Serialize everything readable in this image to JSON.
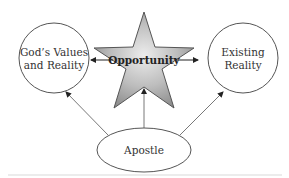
{
  "diagram": {
    "nodes": {
      "left": {
        "line1": "God’s Values",
        "line2": "and Reality",
        "shape": "circle"
      },
      "center": {
        "label": "Opportunity",
        "shape": "star"
      },
      "right": {
        "line1": "Existing",
        "line2": "Reality",
        "shape": "circle"
      },
      "bottom": {
        "label": "Apostle",
        "shape": "ellipse"
      }
    },
    "edges": [
      {
        "from": "center",
        "to": "left"
      },
      {
        "from": "center",
        "to": "right"
      },
      {
        "from": "bottom",
        "to": "left"
      },
      {
        "from": "bottom",
        "to": "center"
      },
      {
        "from": "bottom",
        "to": "right"
      }
    ],
    "colors": {
      "stroke": "#555555",
      "star_light": "#e6e6e6",
      "star_dark": "#8a8a8a",
      "footer_line": "#d9d9d9"
    }
  }
}
